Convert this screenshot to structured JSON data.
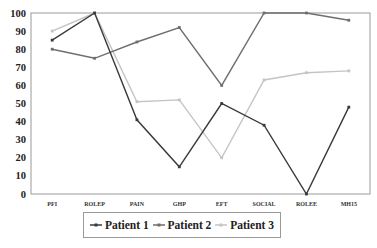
{
  "chart_data": {
    "type": "line",
    "title": "",
    "xlabel": "",
    "ylabel": "",
    "ylim": [
      0,
      100
    ],
    "yticks": [
      0,
      10,
      20,
      30,
      40,
      50,
      60,
      70,
      80,
      90,
      100
    ],
    "grid": false,
    "legend_position": "bottom",
    "categories": [
      "PFI",
      "ROLEP",
      "PAIN",
      "GHP",
      "EFT",
      "SOCIAL",
      "ROLEE",
      "MH15"
    ],
    "series": [
      {
        "name": "Patient 1",
        "color": "#3a3a3a",
        "values": [
          85,
          100,
          41,
          15,
          50,
          38,
          0,
          48
        ]
      },
      {
        "name": "Patient 2",
        "color": "#6e6e6e",
        "values": [
          80,
          75,
          84,
          92,
          60,
          100,
          100,
          96
        ]
      },
      {
        "name": "Patient 3",
        "color": "#c4c4c4",
        "values": [
          90,
          100,
          51,
          52,
          20,
          63,
          67,
          68
        ]
      }
    ]
  },
  "legend": {
    "items": [
      {
        "label": "Patient 1"
      },
      {
        "label": "Patient 2"
      },
      {
        "label": "Patient 3"
      }
    ]
  }
}
